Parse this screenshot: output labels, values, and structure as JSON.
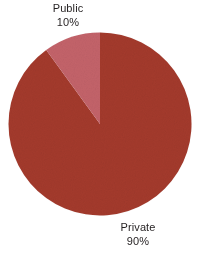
{
  "chart_data": {
    "type": "pie",
    "title": "",
    "categories": [
      "Private",
      "Public"
    ],
    "values": [
      90,
      10
    ],
    "unit": "%",
    "slices": [
      {
        "label": "Private",
        "value": 90,
        "value_label": "90%",
        "color": "#a43a2c",
        "start_angle_deg": 0,
        "end_angle_deg": 324
      },
      {
        "label": "Public",
        "value": 10,
        "value_label": "10%",
        "color": "#c4636a",
        "start_angle_deg": 324,
        "end_angle_deg": 360
      }
    ],
    "legend": "none",
    "labels_position": "outside",
    "start_angle_deg": 0,
    "direction": "clockwise",
    "background": "#ffffff",
    "text_color": "#231f20"
  },
  "labels": {
    "public": {
      "name": "Public",
      "value": "10%"
    },
    "private": {
      "name": "Private",
      "value": "90%"
    }
  },
  "geometry": {
    "center_x": 92,
    "center_y": 92,
    "radius": 91.5
  }
}
